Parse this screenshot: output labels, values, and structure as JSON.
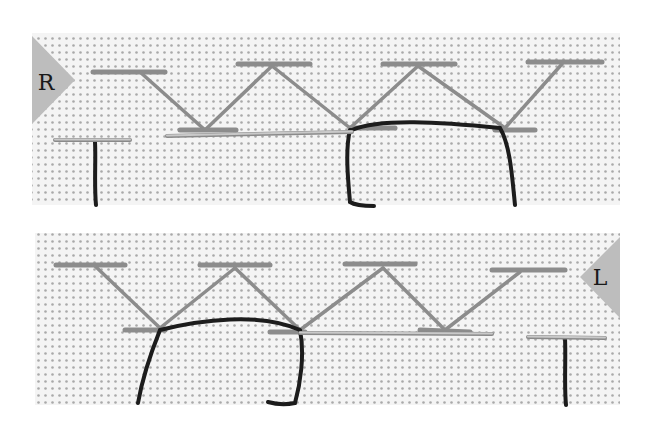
{
  "image": {
    "description": "Two-panel embroidery instruction photo: herringbone stitch worked on white Aida cloth, right-handed (top) and left-handed (bottom)",
    "background": "#ffffff"
  },
  "colors": {
    "fabric": "#f4f4f4",
    "fabric_hole": "#a9a9a9",
    "light_thread": "#8c8c8c",
    "dark_thread": "#1c1c1c",
    "needle": "#c9c9c9",
    "needle_edge": "#8a8a8a",
    "badge": "#bdbdbd"
  },
  "panels": [
    {
      "id": "top",
      "label": "R",
      "meaning": "right-handed",
      "rect": {
        "x": 32,
        "y": 33,
        "w": 588,
        "h": 172
      },
      "badge": {
        "side": "left",
        "points": "32,36 75,80 32,124",
        "label_x": 46,
        "label_y": 90
      },
      "top_bars": [
        [
          93,
          72,
          165,
          72
        ],
        [
          238,
          64,
          310,
          64
        ],
        [
          383,
          64,
          455,
          64
        ],
        [
          528,
          62,
          602,
          62
        ]
      ],
      "bottom_bars": [
        [
          180,
          130,
          236,
          130
        ],
        [
          350,
          128,
          395,
          128
        ],
        [
          495,
          130,
          535,
          130
        ]
      ],
      "diagonals": [
        [
          140,
          72,
          205,
          130
        ],
        [
          272,
          66,
          205,
          130
        ],
        [
          272,
          66,
          350,
          128
        ],
        [
          418,
          66,
          350,
          128
        ],
        [
          418,
          66,
          505,
          128
        ],
        [
          562,
          64,
          505,
          128
        ]
      ],
      "needles": [
        [
          55,
          140,
          130,
          140
        ],
        [
          167,
          136,
          352,
          132
        ]
      ],
      "dark_thread": "M95,142 C96,160 94,185 96,205 M352,130 C380,118 440,122 500,128 C510,145 512,175 515,205 M350,130 C345,150 348,180 350,202 C356,206 368,206 374,206"
    },
    {
      "id": "bottom",
      "label": "L",
      "meaning": "left-handed",
      "rect": {
        "x": 35,
        "y": 233,
        "w": 585,
        "h": 172
      },
      "badge": {
        "side": "right",
        "points": "620,237 580,277 620,318",
        "label_x": 600,
        "label_y": 285
      },
      "top_bars": [
        [
          56,
          265,
          125,
          265
        ],
        [
          200,
          265,
          270,
          265
        ],
        [
          345,
          264,
          415,
          264
        ],
        [
          492,
          270,
          565,
          270
        ]
      ],
      "bottom_bars": [
        [
          125,
          330,
          165,
          330
        ],
        [
          270,
          332,
          305,
          332
        ],
        [
          420,
          330,
          470,
          332
        ]
      ],
      "diagonals": [
        [
          95,
          266,
          160,
          328
        ],
        [
          235,
          268,
          160,
          328
        ],
        [
          235,
          268,
          300,
          330
        ],
        [
          383,
          268,
          300,
          330
        ],
        [
          383,
          268,
          445,
          330
        ],
        [
          520,
          272,
          445,
          330
        ]
      ],
      "needles": [
        [
          300,
          333,
          492,
          334
        ],
        [
          528,
          337,
          605,
          338
        ]
      ],
      "dark_thread": "M160,330 C200,320 260,312 300,330 M160,330 C150,355 142,380 138,403 M300,330 C305,355 300,385 295,403 C285,405 275,404 268,402 M565,338 C566,360 564,385 566,405"
    }
  ]
}
